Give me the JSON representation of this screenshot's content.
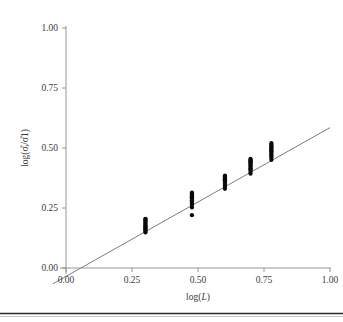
{
  "figure": {
    "title": "",
    "caption": "",
    "has_bottom_rule": true
  },
  "axes": {
    "x_title_prefix": "log(",
    "x_title_var": "L",
    "x_title_suffix": ")",
    "y_title": "log(σ̂ᵢ/σ̂1)",
    "x_ticks": [
      "0.00",
      "0.25",
      "0.50",
      "0.75",
      "1.00"
    ],
    "y_ticks": [
      "0.00",
      "0.25",
      "0.50",
      "0.75",
      "1.00"
    ]
  },
  "chart_data": {
    "type": "scatter",
    "title": "",
    "subtitle": "",
    "xlabel": "log(L)",
    "ylabel": "log(σ̂ᵢ/σ̂1)",
    "xlim": [
      0.0,
      1.0
    ],
    "ylim": [
      0.0,
      1.0
    ],
    "xticks": [
      0.0,
      0.25,
      0.5,
      0.75,
      1.0
    ],
    "yticks": [
      0.0,
      0.25,
      0.5,
      0.75,
      1.0
    ],
    "xticklabels": [
      "0.00",
      "0.25",
      "0.50",
      "0.75",
      "1.00"
    ],
    "yticklabels": [
      "0.00",
      "0.25",
      "0.50",
      "0.75",
      "1.00"
    ],
    "grid": false,
    "legend": false,
    "legend_position": "none",
    "marker": "filled-circle",
    "marker_color": "#0b0b0b",
    "marker_size_px": 2.1,
    "line_color": "#6e6e6e",
    "axis_color": "#8a8a8a",
    "background": "#ffffff",
    "fit_line": {
      "type": "linear",
      "slope": 0.62,
      "intercept": -0.035,
      "x_start": -0.05,
      "x_end": 1.0,
      "y_start": -0.066,
      "y_end": 0.585
    },
    "groups": [
      {
        "name": "L1",
        "x": 0.301,
        "y_values": [
          0.148,
          0.152,
          0.157,
          0.161,
          0.165,
          0.17,
          0.174,
          0.178,
          0.183,
          0.187,
          0.192,
          0.196,
          0.2,
          0.204,
          0.205
        ]
      },
      {
        "name": "L2",
        "x": 0.477,
        "y_values": [
          0.22,
          0.252,
          0.262,
          0.27,
          0.277,
          0.282,
          0.287,
          0.291,
          0.295,
          0.299,
          0.302,
          0.305,
          0.308,
          0.311,
          0.314
        ]
      },
      {
        "name": "L3",
        "x": 0.602,
        "y_values": [
          0.33,
          0.337,
          0.342,
          0.347,
          0.351,
          0.355,
          0.359,
          0.363,
          0.366,
          0.37,
          0.373,
          0.376,
          0.379,
          0.382,
          0.385
        ]
      },
      {
        "name": "L4",
        "x": 0.699,
        "y_values": [
          0.393,
          0.4,
          0.406,
          0.411,
          0.416,
          0.421,
          0.425,
          0.429,
          0.433,
          0.437,
          0.441,
          0.444,
          0.448,
          0.451,
          0.455
        ]
      },
      {
        "name": "L5",
        "x": 0.778,
        "y_values": [
          0.45,
          0.458,
          0.464,
          0.47,
          0.475,
          0.48,
          0.485,
          0.489,
          0.493,
          0.497,
          0.501,
          0.505,
          0.509,
          0.513,
          0.52
        ]
      }
    ]
  }
}
